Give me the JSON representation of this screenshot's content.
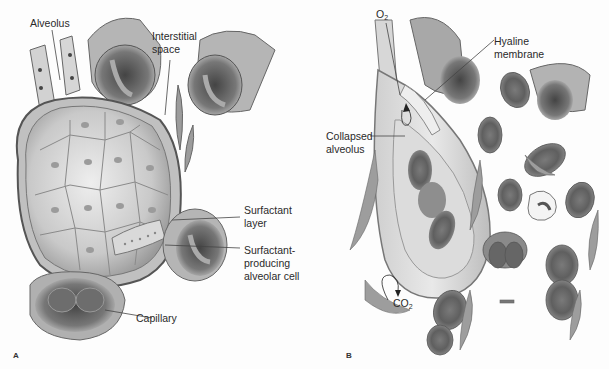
{
  "figure": {
    "panels": [
      {
        "id": "A",
        "label": "A",
        "labels": {
          "alveolus": "Alveolus",
          "interstitial_1": "Interstitial",
          "interstitial_2": "space",
          "surfactant_layer_1": "Surfactant",
          "surfactant_layer_2": "layer",
          "surf_cell_1": "Surfactant-",
          "surf_cell_2": "producing",
          "surf_cell_3": "alveolar cell",
          "capillary": "Capillary"
        }
      },
      {
        "id": "B",
        "label": "B",
        "labels": {
          "o2": "O",
          "o2_sub": "2",
          "hyaline_1": "Hyaline",
          "hyaline_2": "membrane",
          "collapsed_1": "Collapsed",
          "collapsed_2": "alveolus",
          "co2": "CO",
          "co2_sub": "2"
        }
      }
    ],
    "colors": {
      "background": "#fdfdfd",
      "tissue_light": "#d8d8d8",
      "tissue_mid": "#a9a9a9",
      "tissue_dark": "#555555",
      "leader_line": "#444444"
    }
  }
}
